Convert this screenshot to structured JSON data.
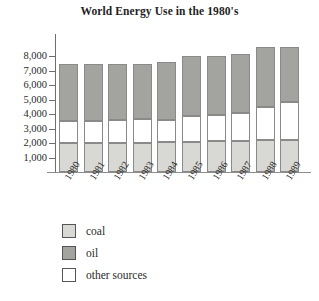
{
  "chart_data": {
    "type": "bar",
    "subtype": "stacked-bar",
    "title": "World Energy Use in the 1980's",
    "xlabel": "",
    "ylabel": "",
    "categories": [
      "1980",
      "1981",
      "1982",
      "1983",
      "1984",
      "1985",
      "1986",
      "1987",
      "1988",
      "1989"
    ],
    "series": [
      {
        "name": "coal",
        "color": "#d8d8d4",
        "values": [
          2000,
          2000,
          2000,
          2000,
          2050,
          2050,
          2150,
          2150,
          2200,
          2200
        ]
      },
      {
        "name": "other sources",
        "color": "#ffffff",
        "values": [
          1500,
          1550,
          1600,
          1650,
          1550,
          1800,
          1800,
          1950,
          2300,
          2600
        ]
      },
      {
        "name": "oil",
        "color": "#a3a3a0",
        "values": [
          3950,
          3900,
          3850,
          3800,
          4000,
          4150,
          4050,
          4050,
          4100,
          3800
        ]
      }
    ],
    "stack_order": [
      "coal",
      "other sources",
      "oil"
    ],
    "totals": [
      7450,
      7450,
      7450,
      7450,
      7600,
      8000,
      8000,
      8150,
      8600,
      8600
    ],
    "ylim": [
      0,
      9000
    ],
    "yticks": [
      1000,
      2000,
      3000,
      4000,
      5000,
      6000,
      7000,
      8000
    ],
    "ytick_labels": [
      "1,000",
      "2,000",
      "3,000",
      "4,000",
      "5,000",
      "6,000",
      "7,000",
      "8,000"
    ],
    "grid": false,
    "legend_position": "below-left",
    "legend": [
      {
        "label": "coal",
        "color": "#d8d8d4"
      },
      {
        "label": "oil",
        "color": "#a3a3a0"
      },
      {
        "label": "other sources",
        "color": "#ffffff"
      }
    ]
  },
  "colors": {
    "coal": "#d8d8d4",
    "oil": "#a3a3a0",
    "other_sources": "#ffffff",
    "axis": "#6e6e6e",
    "outline": "#8a8a8a",
    "text": "#2b2b2b",
    "background": "#ffffff"
  }
}
